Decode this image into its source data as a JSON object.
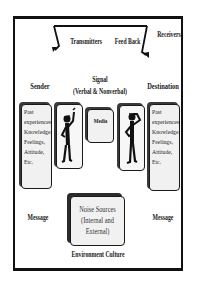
{
  "diagram": {
    "top_labels": {
      "transmitters": "Transmitters",
      "feedback": "Feed Back",
      "receivers": "Receivers"
    },
    "sender": {
      "label": "Sender",
      "attributes": [
        "Past",
        "experiences",
        "Knowledge,",
        "Feelings,",
        "Attitude,",
        "Etc."
      ],
      "message_label": "Message",
      "figure_icon": "person-raising-hand-icon"
    },
    "signal": {
      "label": "Signal",
      "sublabel": "(Verbal & Nonverbal)"
    },
    "media": {
      "label": "Media"
    },
    "destination": {
      "label": "Destination",
      "attributes": [
        "Past",
        "experiences",
        "Knowledge,",
        "Feelings,",
        "Attitude,",
        "Etc."
      ],
      "message_label": "Message",
      "figure_icon": "person-thinking-icon"
    },
    "noise": {
      "lines": [
        "Noise Sources",
        "(Internal and",
        "External)"
      ]
    },
    "environment_label": "Environment Culture",
    "colors": {
      "border": "#111111",
      "box_fill": "#f1f1f1",
      "shadow": "#3a3a3a"
    }
  }
}
